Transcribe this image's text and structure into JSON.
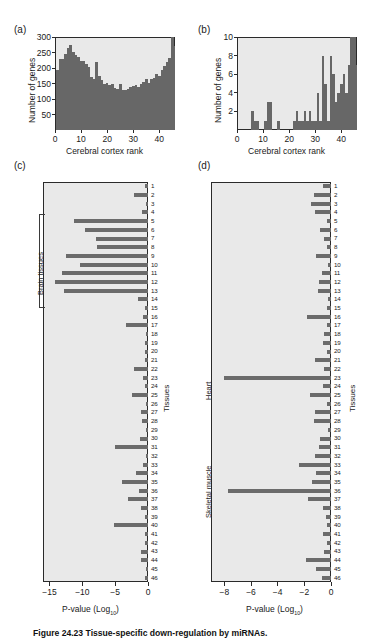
{
  "figure": {
    "caption": "Figure 24.23  Tissue-specific down-regulation by miRNAs.",
    "panel_letters": {
      "a": "(a)",
      "b": "(b)",
      "c": "(c)",
      "d": "(d)"
    }
  },
  "chart_data": [
    {
      "id": "panel-a",
      "type": "bar",
      "title": "(a)",
      "xlabel": "Cerebral cortex rank",
      "ylabel": "Number of genes",
      "xlim": [
        0,
        46
      ],
      "ylim": [
        0,
        300
      ],
      "xticks": [
        0,
        10,
        20,
        30,
        40
      ],
      "yticks": [
        50,
        100,
        150,
        200,
        250,
        300
      ],
      "grid": false,
      "bar_color": "#676767",
      "plot_bg": "#e9e9e9",
      "categories": [
        1,
        2,
        3,
        4,
        5,
        6,
        7,
        8,
        9,
        10,
        11,
        12,
        13,
        14,
        15,
        16,
        17,
        18,
        19,
        20,
        21,
        22,
        23,
        24,
        25,
        26,
        27,
        28,
        29,
        30,
        31,
        32,
        33,
        34,
        35,
        36,
        37,
        38,
        39,
        40,
        41,
        42,
        43,
        44,
        45,
        46
      ],
      "values": [
        192,
        230,
        228,
        244,
        265,
        275,
        253,
        243,
        235,
        222,
        222,
        214,
        203,
        172,
        166,
        219,
        174,
        161,
        150,
        152,
        145,
        149,
        136,
        133,
        150,
        130,
        129,
        131,
        138,
        142,
        146,
        140,
        148,
        155,
        163,
        152,
        166,
        168,
        182,
        174,
        195,
        206,
        220,
        232,
        299,
        270
      ]
    },
    {
      "id": "panel-b",
      "type": "bar",
      "title": "(b)",
      "xlabel": "Cerebral cortex rank",
      "ylabel": "Number of genes",
      "xlim": [
        0,
        46
      ],
      "ylim": [
        0,
        10
      ],
      "xticks": [
        0,
        10,
        20,
        30,
        40
      ],
      "yticks": [
        2,
        4,
        6,
        8,
        10
      ],
      "grid": false,
      "bar_color": "#676767",
      "plot_bg": "#e9e9e9",
      "categories": [
        1,
        2,
        3,
        4,
        5,
        6,
        7,
        8,
        9,
        10,
        11,
        12,
        13,
        14,
        15,
        16,
        17,
        18,
        19,
        20,
        21,
        22,
        23,
        24,
        25,
        26,
        27,
        28,
        29,
        30,
        31,
        32,
        33,
        34,
        35,
        36,
        37,
        38,
        39,
        40,
        41,
        42,
        43,
        44,
        45,
        46
      ],
      "values": [
        0,
        0,
        0,
        0,
        0,
        2,
        1,
        1,
        0,
        0,
        1,
        3,
        3,
        0,
        0,
        1,
        0,
        0,
        0,
        0,
        0,
        1,
        2,
        1,
        1,
        2,
        1,
        2,
        1,
        1,
        4,
        1,
        8,
        5,
        1,
        8,
        6,
        3,
        4,
        5,
        6,
        4,
        7,
        10,
        10,
        7
      ]
    },
    {
      "id": "panel-c",
      "type": "bar",
      "orientation": "horizontal",
      "title": "(c)",
      "xlabel": "P-value (Log10)",
      "ylabel": "Tissues",
      "xlim": [
        -16,
        0
      ],
      "xticks": [
        -15,
        -10,
        -5,
        0
      ],
      "grid": false,
      "bar_color": "#6b6b6b",
      "plot_bg": "#e9e9e9",
      "group_label": "Brain tissues",
      "group_rows": [
        5,
        13
      ],
      "categories": [
        1,
        2,
        3,
        4,
        5,
        6,
        7,
        8,
        9,
        10,
        11,
        12,
        13,
        14,
        15,
        16,
        17,
        18,
        19,
        20,
        21,
        22,
        23,
        24,
        25,
        26,
        27,
        28,
        29,
        30,
        31,
        32,
        33,
        34,
        35,
        36,
        37,
        38,
        39,
        40,
        41,
        42,
        43,
        44,
        45,
        46
      ],
      "values": [
        -0.5,
        -2.2,
        -0.3,
        -0.9,
        -11.3,
        -9.6,
        -7.9,
        -7.8,
        -12.5,
        -10.4,
        -13.1,
        -14.2,
        -12.8,
        -1.6,
        -0.4,
        -0.8,
        -3.4,
        -0.3,
        -0.5,
        -0.4,
        -0.5,
        -2.1,
        -0.8,
        -0.4,
        -2.4,
        -0.3,
        -1.0,
        -0.9,
        -0.3,
        -1.2,
        -5.0,
        -0.3,
        -0.7,
        -1.9,
        -3.9,
        -1.4,
        -3.1,
        -1.0,
        -0.4,
        -5.2,
        -0.5,
        -0.4,
        -1.0,
        -1.1,
        -0.3,
        -0.5
      ]
    },
    {
      "id": "panel-d",
      "type": "bar",
      "orientation": "horizontal",
      "title": "(d)",
      "xlabel": "P-value (Log10)",
      "ylabel": "Tissues",
      "xlim": [
        -9,
        0
      ],
      "xticks": [
        -8,
        -6,
        -4,
        -2,
        0
      ],
      "grid": false,
      "bar_color": "#6b6b6b",
      "plot_bg": "#e9e9e9",
      "group_labels": [
        "Heart",
        "Skeletal muscle"
      ],
      "heart_row": 23,
      "skeletal_row": 36,
      "categories": [
        1,
        2,
        3,
        4,
        5,
        6,
        7,
        8,
        9,
        10,
        11,
        12,
        13,
        14,
        15,
        16,
        17,
        18,
        19,
        20,
        21,
        22,
        23,
        24,
        25,
        26,
        27,
        28,
        29,
        30,
        31,
        32,
        33,
        34,
        35,
        36,
        37,
        38,
        39,
        40,
        41,
        42,
        43,
        44,
        45,
        46
      ],
      "values": [
        -0.6,
        -1.3,
        -1.5,
        -1.2,
        -0.3,
        -0.8,
        -0.5,
        -0.3,
        -1.1,
        -0.2,
        -0.7,
        -0.9,
        -1.0,
        -0.2,
        -0.3,
        -1.8,
        -0.3,
        -0.5,
        -0.6,
        -0.3,
        -1.2,
        -0.5,
        -8.0,
        -0.6,
        -1.6,
        -0.3,
        -1.2,
        -1.3,
        -0.2,
        -0.8,
        -0.9,
        -1.2,
        -2.4,
        -1.1,
        -1.4,
        -7.7,
        -1.7,
        -0.6,
        -0.4,
        -0.3,
        -0.6,
        -0.3,
        -0.5,
        -1.9,
        -1.1,
        -0.7
      ]
    }
  ],
  "panel_a": {
    "letter": "(a)",
    "ylabel": "Number of genes",
    "xlabel": "Cerebral cortex rank",
    "yticks": [
      "300",
      "250",
      "200",
      "150",
      "100",
      "50"
    ],
    "xticks": [
      "0",
      "10",
      "20",
      "30",
      "40"
    ]
  },
  "panel_b": {
    "letter": "(b)",
    "ylabel": "Number of genes",
    "xlabel": "Cerebral cortex rank",
    "yticks": [
      "10",
      "8",
      "6",
      "4",
      "2"
    ],
    "xticks": [
      "0",
      "10",
      "20",
      "30",
      "40"
    ]
  },
  "panel_c": {
    "letter": "(c)",
    "xlabel_main": "P-value (Log",
    "xlabel_sub": "10",
    "xlabel_close": ")",
    "ylabel": "Tissues",
    "group_label": "Brain tissues",
    "xticks": [
      "−15",
      "−10",
      "−5",
      "0"
    ]
  },
  "panel_d": {
    "letter": "(d)",
    "xlabel_main": "P-value (Log",
    "xlabel_sub": "10",
    "xlabel_close": ")",
    "ylabel": "Tissues",
    "group_label_heart": "Heart",
    "group_label_skeletal": "Skeletal muscle",
    "xticks": [
      "−8",
      "−6",
      "−4",
      "−2",
      "0"
    ]
  },
  "row_numbers": [
    "1",
    "2",
    "3",
    "4",
    "5",
    "6",
    "7",
    "8",
    "9",
    "10",
    "11",
    "12",
    "13",
    "14",
    "15",
    "16",
    "17",
    "18",
    "19",
    "20",
    "21",
    "22",
    "23",
    "24",
    "25",
    "26",
    "27",
    "28",
    "29",
    "30",
    "31",
    "32",
    "33",
    "34",
    "35",
    "36",
    "37",
    "38",
    "39",
    "40",
    "41",
    "42",
    "43",
    "44",
    "45",
    "46"
  ]
}
